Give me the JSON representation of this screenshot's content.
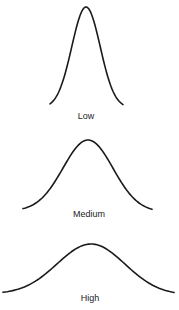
{
  "diagram": {
    "title": "",
    "stroke_color": "#1a1a1a",
    "label_color": "#222222",
    "background": "#ffffff",
    "curves": [
      {
        "label": "Low",
        "peak": {
          "x": 86,
          "y": 7
        },
        "left_tail": {
          "x": 50,
          "y": 108
        },
        "right_tail": {
          "x": 123,
          "y": 108
        },
        "label_pos": {
          "x": 86,
          "y": 111
        }
      },
      {
        "label": "Medium",
        "peak": {
          "x": 88,
          "y": 140
        },
        "left_tail": {
          "x": 23,
          "y": 211
        },
        "right_tail": {
          "x": 152,
          "y": 212
        },
        "label_pos": {
          "x": 89,
          "y": 209
        }
      },
      {
        "label": "High",
        "peak": {
          "x": 91,
          "y": 244
        },
        "left_tail": {
          "x": 3,
          "y": 294
        },
        "right_tail": {
          "x": 174,
          "y": 295
        },
        "label_pos": {
          "x": 90,
          "y": 293
        }
      }
    ]
  }
}
